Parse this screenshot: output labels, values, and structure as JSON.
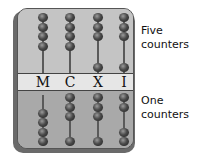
{
  "diagram": {
    "type": "abacus",
    "columns": [
      {
        "label": "M",
        "upper_beads_top": 4,
        "upper_beads_bottom": 0,
        "lower_beads_top": 0,
        "lower_beads_bottom": 4
      },
      {
        "label": "C",
        "upper_beads_top": 4,
        "upper_beads_bottom": 0,
        "lower_beads_top": 3,
        "lower_beads_bottom": 1
      },
      {
        "label": "X",
        "upper_beads_top": 3,
        "upper_beads_bottom": 1,
        "lower_beads_top": 3,
        "lower_beads_bottom": 1
      },
      {
        "label": "I",
        "upper_beads_top": 3,
        "upper_beads_bottom": 1,
        "lower_beads_top": 2,
        "lower_beads_bottom": 2
      }
    ],
    "annotations": {
      "upper": "Five counters",
      "upper_line1": "Five",
      "upper_line2": "counters",
      "lower": "One counters",
      "lower_line1": "One",
      "lower_line2": "counters"
    },
    "colors": {
      "frame": "#b5b5b5",
      "band": "#e6e6e6",
      "bead": "#2e2e2e"
    }
  }
}
